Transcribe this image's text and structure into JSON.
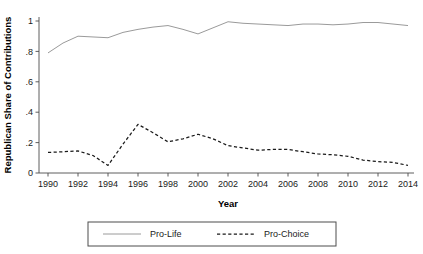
{
  "chart_data": {
    "type": "line",
    "title": "",
    "xlabel": "Year",
    "ylabel": "Republican Share of Contributions",
    "xlim": [
      1990,
      2014
    ],
    "ylim": [
      0,
      1
    ],
    "grid": false,
    "legend_position": "bottom",
    "x": [
      1990,
      1991,
      1992,
      1993,
      1994,
      1995,
      1996,
      1997,
      1998,
      1999,
      2000,
      2001,
      2002,
      2003,
      2004,
      2005,
      2006,
      2007,
      2008,
      2009,
      2010,
      2011,
      2012,
      2013,
      2014
    ],
    "xticks": [
      1990,
      1992,
      1994,
      1996,
      1998,
      2000,
      2002,
      2004,
      2006,
      2008,
      2010,
      2012,
      2014
    ],
    "xtick_labels": [
      "1990",
      "1992",
      "1994",
      "1996",
      "1998",
      "2000",
      "2002",
      "2004",
      "2006",
      "2008",
      "2010",
      "2012",
      "2014"
    ],
    "yticks": [
      0,
      0.2,
      0.4,
      0.6,
      0.8,
      1
    ],
    "ytick_labels": [
      "0",
      ".2",
      ".4",
      ".6",
      ".8",
      "1"
    ],
    "series": [
      {
        "name": "Pro-Life",
        "style": "solid",
        "color": "#9a9a9a",
        "values": [
          0.79,
          0.855,
          0.9,
          0.895,
          0.89,
          0.925,
          0.945,
          0.96,
          0.97,
          0.945,
          0.915,
          0.955,
          0.995,
          0.985,
          0.98,
          0.975,
          0.97,
          0.98,
          0.98,
          0.975,
          0.98,
          0.99,
          0.99,
          0.98,
          0.97
        ]
      },
      {
        "name": "Pro-Choice",
        "style": "dashed",
        "color": "#1a1a1a",
        "values": [
          0.135,
          0.14,
          0.145,
          0.115,
          0.05,
          0.19,
          0.32,
          0.265,
          0.205,
          0.225,
          0.255,
          0.225,
          0.18,
          0.165,
          0.15,
          0.155,
          0.155,
          0.14,
          0.125,
          0.12,
          0.11,
          0.085,
          0.075,
          0.07,
          0.05
        ]
      }
    ]
  },
  "legend": {
    "entries": [
      {
        "label": "Pro-Life",
        "style": "solid"
      },
      {
        "label": "Pro-Choice",
        "style": "dashed"
      }
    ]
  }
}
